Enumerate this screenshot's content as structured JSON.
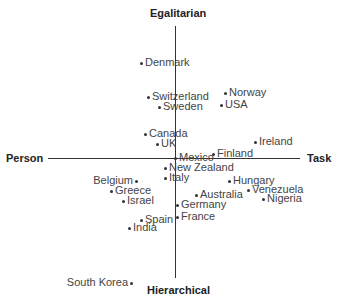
{
  "chart_data": {
    "type": "scatter",
    "title": "",
    "axes": {
      "top": "Egalitarian",
      "bottom": "Hierarchical",
      "left": "Person",
      "right": "Task"
    },
    "points": [
      {
        "label": "Denmark",
        "x": 141,
        "y": 62,
        "label_side": "right"
      },
      {
        "label": "Switzerland",
        "x": 148,
        "y": 96,
        "label_side": "right"
      },
      {
        "label": "Sweden",
        "x": 159,
        "y": 106,
        "label_side": "right"
      },
      {
        "label": "Norway",
        "x": 225,
        "y": 92,
        "label_side": "right"
      },
      {
        "label": "USA",
        "x": 221,
        "y": 104,
        "label_side": "right"
      },
      {
        "label": "Canada",
        "x": 145,
        "y": 133,
        "label_side": "right"
      },
      {
        "label": "UK",
        "x": 157,
        "y": 143,
        "label_side": "right"
      },
      {
        "label": "Ireland",
        "x": 255,
        "y": 141,
        "label_side": "right"
      },
      {
        "label": "Mexico",
        "x": 175,
        "y": 157,
        "label_side": "right"
      },
      {
        "label": "Finland",
        "x": 213,
        "y": 153,
        "label_side": "right"
      },
      {
        "label": "New Zealand",
        "x": 165,
        "y": 167,
        "label_side": "right"
      },
      {
        "label": "Italy",
        "x": 165,
        "y": 177,
        "label_side": "right"
      },
      {
        "label": "Belgium",
        "x": 136,
        "y": 180,
        "label_side": "left"
      },
      {
        "label": "Hungary",
        "x": 229,
        "y": 180,
        "label_side": "right"
      },
      {
        "label": "Greece",
        "x": 111,
        "y": 190,
        "label_side": "right"
      },
      {
        "label": "Australia",
        "x": 196,
        "y": 194,
        "label_side": "right"
      },
      {
        "label": "Venezuela",
        "x": 248,
        "y": 189,
        "label_side": "right"
      },
      {
        "label": "Israel",
        "x": 123,
        "y": 200,
        "label_side": "right"
      },
      {
        "label": "Nigeria",
        "x": 263,
        "y": 198,
        "label_side": "right"
      },
      {
        "label": "Germany",
        "x": 177,
        "y": 204,
        "label_side": "right"
      },
      {
        "label": "France",
        "x": 177,
        "y": 216,
        "label_side": "right"
      },
      {
        "label": "Spain",
        "x": 141,
        "y": 219,
        "label_side": "right"
      },
      {
        "label": "India",
        "x": 129,
        "y": 227,
        "label_side": "right"
      },
      {
        "label": "South Korea",
        "x": 131,
        "y": 282,
        "label_side": "left"
      }
    ],
    "grid": false,
    "legend": "none"
  }
}
